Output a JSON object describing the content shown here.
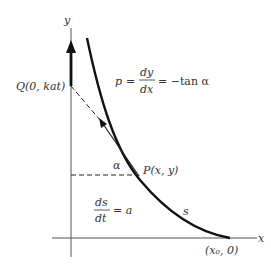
{
  "diagram": {
    "axes": {
      "x_label": "x",
      "y_label": "y"
    },
    "points": {
      "Q": {
        "label": "Q(0, kat)"
      },
      "P": {
        "label": "P(x, y)"
      },
      "start": {
        "label": "(x₀, 0)"
      }
    },
    "equations": {
      "slope": {
        "lhs": "p",
        "eq": "=",
        "num": "dy",
        "den": "dx",
        "rhs": "= −tan α"
      },
      "speed": {
        "num": "ds",
        "den": "dt",
        "rhs": "= a"
      }
    },
    "angle_label": "α",
    "arc_label": "s",
    "colors": {
      "ink": "#1a1a1a",
      "text": "#333333",
      "background": "#ffffff"
    }
  }
}
